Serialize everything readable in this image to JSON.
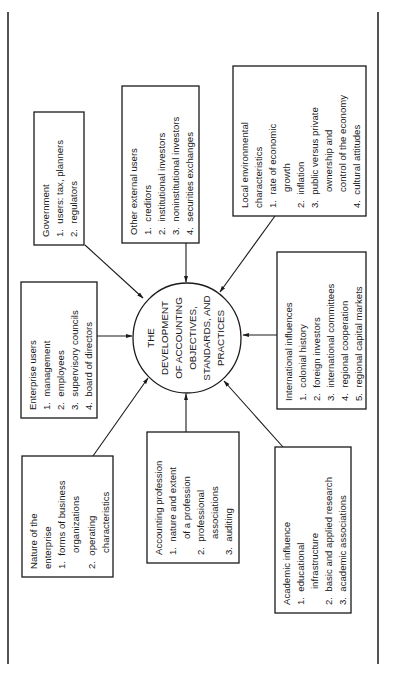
{
  "center": {
    "lines": [
      "THE",
      "DEVELOPMENT",
      "OF ACCOUNTING",
      "OBJECTIVES,",
      "STANDARDS, AND",
      "PRACTICES"
    ]
  },
  "boxes": {
    "government": {
      "title": "Government",
      "items": [
        "1.  users: tax, planners",
        "2.  regulators"
      ]
    },
    "other_external_users": {
      "title": "Other external users",
      "items": [
        "1.  creditors",
        "2.  institutional investors",
        "3.  noninstitutional investors",
        "4.  securities exchanges"
      ]
    },
    "local_environmental": {
      "title": "Local environmental",
      "title2": "characteristics",
      "items": [
        "1.  rate of economic",
        "      growth",
        "2.  inflation",
        "3.  public versus private",
        "      ownership and",
        "      control of the economy",
        "4.  cultural attitudes"
      ]
    },
    "enterprise_users": {
      "title": "Enterprise users",
      "items": [
        "1.  management",
        "2.  employees",
        "3.  supervisory councils",
        "4.  board of directors"
      ]
    },
    "international_influences": {
      "title": "International influences",
      "items": [
        "1.  colonial history",
        "2.  foreign investors",
        "3.  international committees",
        "4.  regional cooperation",
        "5.  regional capital markets"
      ]
    },
    "nature_of_enterprise": {
      "title": "Nature of the",
      "title2": "enterprise",
      "items": [
        "1.  forms of business",
        "      organizations",
        "2.  operating",
        "      characteristics"
      ]
    },
    "accounting_profession": {
      "title": "Accounting profession",
      "items": [
        "1.  nature and extent",
        "      of a profession",
        "2.  professional",
        "      associations",
        "3.  auditing"
      ]
    },
    "academic_influence": {
      "title": "Academic influence",
      "items": [
        "1.  educational",
        "      infrastructure",
        "2.  basic and applied research",
        "3.  academic associations"
      ]
    }
  }
}
